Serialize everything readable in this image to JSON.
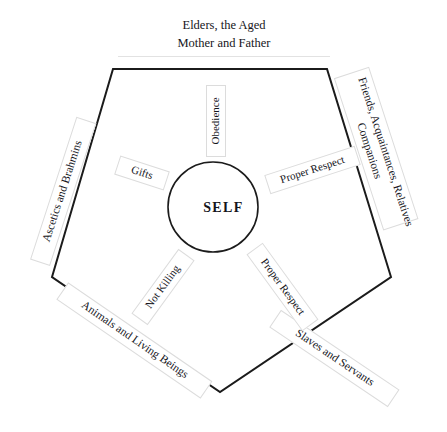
{
  "diagram": {
    "type": "pentagon-radial-relationship-diagram",
    "center": {
      "label": "SELF"
    },
    "outer_labels": [
      {
        "id": "top",
        "position": "top",
        "lines": [
          "Elders, the Aged",
          "Mother and Father"
        ],
        "text": "Elders, the Aged Mother and Father"
      },
      {
        "id": "upper-right",
        "position": "upper-right",
        "lines": [
          "Friends, Acquaintances, Relatives",
          "Companions"
        ],
        "text": "Friends, Acquaintances, Relatives Companions"
      },
      {
        "id": "lower-right",
        "position": "lower-right",
        "lines": [
          "Slaves and Servants"
        ],
        "text": "Slaves and Servants"
      },
      {
        "id": "lower-left",
        "position": "lower-left",
        "lines": [
          "Animals and Living Beings"
        ],
        "text": "Animals and Living Beings"
      },
      {
        "id": "upper-left",
        "position": "upper-left",
        "lines": [
          "Ascetics and Brahmins"
        ],
        "text": "Ascetics and Brahmins"
      }
    ],
    "inner_labels": [
      {
        "id": "obedience",
        "text": "Obedience",
        "sector": "top"
      },
      {
        "id": "proper-respect-right",
        "text": "Proper Respect",
        "sector": "upper-right"
      },
      {
        "id": "proper-respect-lower-right",
        "text": "Proper Respect",
        "sector": "lower-right"
      },
      {
        "id": "not-killing",
        "text": "Not Killing",
        "sector": "lower-left"
      },
      {
        "id": "gifts",
        "text": "Gifts",
        "sector": "upper-left"
      }
    ],
    "geometry": {
      "pentagon_points": "113,69 327,69 391,277 220,392 52,277",
      "circle_cx": 213,
      "circle_cy": 207,
      "circle_r": 45
    },
    "colors": {
      "background": "#ffffff",
      "outline": "#1b1b1b",
      "text": "#15151b",
      "label_border": "#dcdcdc"
    }
  }
}
